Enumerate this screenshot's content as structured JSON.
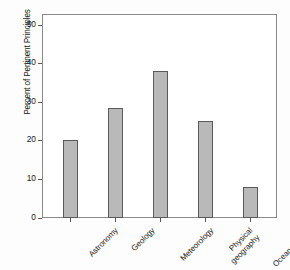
{
  "chart_data": {
    "type": "bar",
    "title": "",
    "subtitle": "",
    "xlabel": "",
    "ylabel": "Percent of Pertinent Principles",
    "categories": [
      "Astronomy",
      "Geology",
      "Meteorology",
      "Physical geography",
      "Oceanography"
    ],
    "values": [
      20.2,
      28.4,
      38.2,
      25.2,
      8.0
    ],
    "ylim": [
      0,
      52
    ],
    "ytick_labels": [
      "0",
      "10",
      "20",
      "30",
      "40",
      "50"
    ],
    "ytick_values": [
      0,
      10,
      20,
      30,
      40,
      50
    ],
    "grid": false,
    "legend": null,
    "series": [
      {
        "name": "Percent of Pertinent Principles",
        "values": [
          20.2,
          28.4,
          38.2,
          25.2,
          8.0
        ]
      }
    ],
    "annotations": []
  },
  "style": {
    "bar_fill": "#b9b9b9",
    "bar_border": "#5a5a5a",
    "frame_border": "#8a8a8a",
    "text_color": "#1a1a1a",
    "background": "#fdfdfd",
    "plot_background": "#ffffff"
  },
  "category_labels": {
    "astronomy": "Astronomy",
    "geology": "Geology",
    "meteorology": "Meteorology",
    "physical_geography_line1": "Physical",
    "physical_geography_line2": "geography",
    "oceanography": "Oceanography"
  }
}
